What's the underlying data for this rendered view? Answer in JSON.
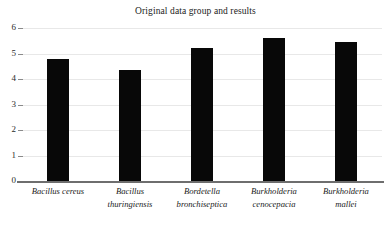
{
  "chart_data": {
    "type": "bar",
    "title": "Original data group and results",
    "xlabel": "",
    "ylabel": "",
    "ylim": [
      0,
      6
    ],
    "yticks": [
      "0",
      "1",
      "2",
      "3",
      "4",
      "5",
      "6"
    ],
    "grid": true,
    "legend": null,
    "bar_color": "#080808",
    "categories": [
      "Bacillus cereus",
      "Bacillus thuringiensis",
      "Bordetella bronchiseptica",
      "Burkholderia cenocepacia",
      "Burkholderia mallei"
    ],
    "category_lines": [
      [
        "Bacillus cereus"
      ],
      [
        "Bacillus",
        "thuringiensis"
      ],
      [
        "Bordetella",
        "bronchiseptica"
      ],
      [
        "Burkholderia",
        "cenocepacia"
      ],
      [
        "Burkholderia",
        "mallei"
      ]
    ],
    "values": [
      4.8,
      4.35,
      5.2,
      5.6,
      5.45
    ]
  }
}
